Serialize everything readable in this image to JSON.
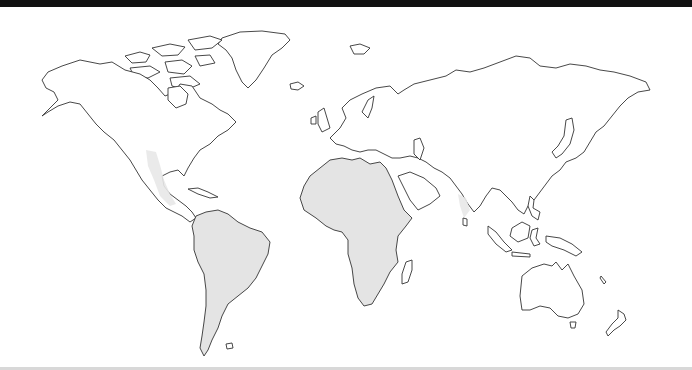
{
  "map": {
    "type": "world outline map",
    "projection": "Miller-like cylindrical",
    "shaded_regions": [
      "Africa",
      "South America",
      "Central America / Mexico (light)",
      "Southern India (light)"
    ],
    "colors": {
      "shaded_fill": "#e4e4e4",
      "outline": "#333333",
      "background": "#ffffff",
      "top_border": "#111111"
    }
  }
}
